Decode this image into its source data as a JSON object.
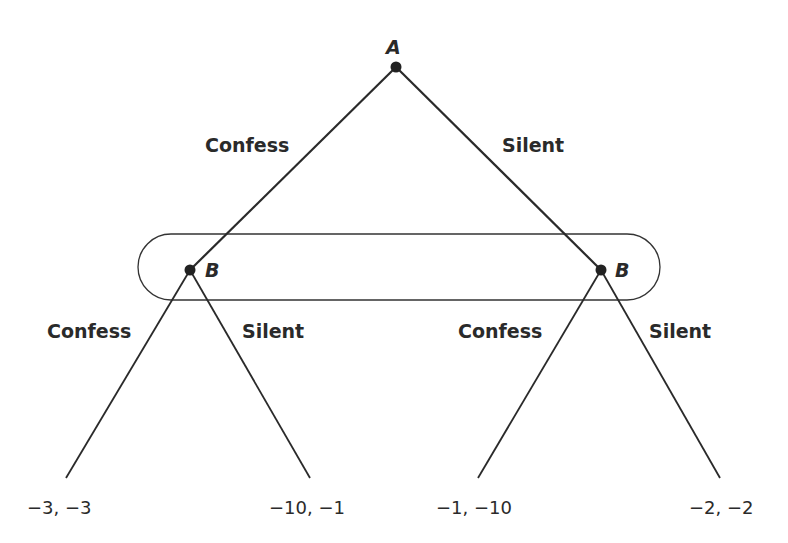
{
  "diagram": {
    "type": "extensive-form game tree",
    "nodes": {
      "root": {
        "label": "A"
      },
      "left": {
        "label": "B"
      },
      "right": {
        "label": "B"
      }
    },
    "edges": {
      "root_left": "Confess",
      "root_right": "Silent",
      "left_left": "Confess",
      "left_right": "Silent",
      "right_left": "Confess",
      "right_right": "Silent"
    },
    "payoffs": [
      "−3, −3",
      "−10, −1",
      "−1, −10",
      "−2, −2"
    ],
    "information_set": "B nodes enclosed in a rounded rectangle",
    "colors": {
      "line": "#2a2a2a",
      "text": "#2a2a2a",
      "background": "#ffffff"
    }
  }
}
